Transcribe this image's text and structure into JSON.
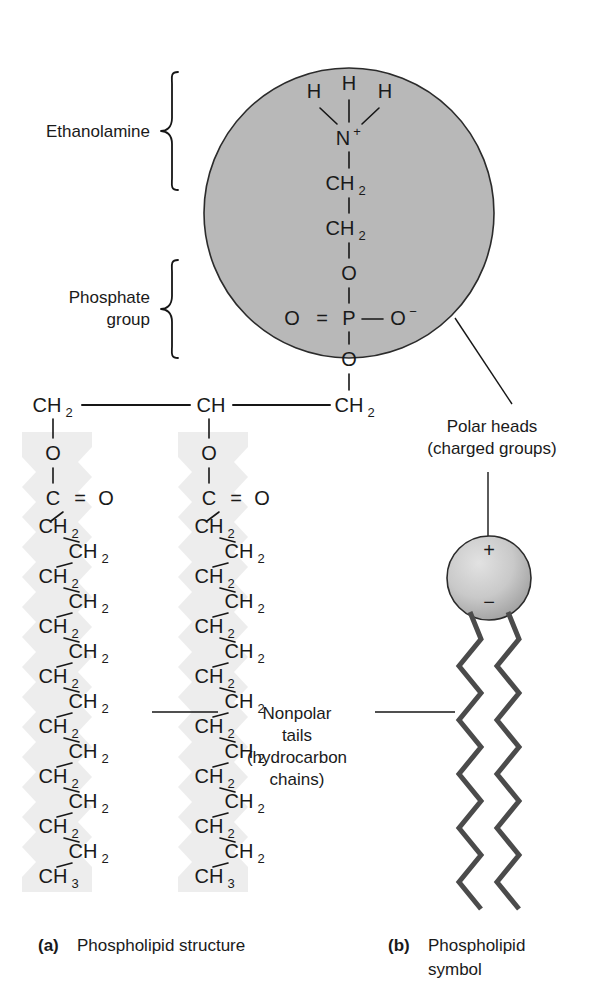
{
  "figure": {
    "background_color": "#ffffff",
    "ink_color": "#161616"
  },
  "colors": {
    "head_circle_fill": "#b8b8b8",
    "head_circle_stroke": "#2b2b2b",
    "tail_highlight": "#ececec",
    "tail_stroke": "#4b4b4b",
    "sphere_light": "#d8d8d8",
    "sphere_dark": "#9a9a9a",
    "text": "#1a1a1a"
  },
  "side_labels": {
    "ethanolamine": "Ethanolamine",
    "phosphate_line1": "Phosphate",
    "phosphate_line2": "group"
  },
  "callouts": {
    "polar_heads_line1": "Polar heads",
    "polar_heads_line2": "(charged groups)",
    "nonpolar_line1": "Nonpolar",
    "nonpolar_line2": "tails",
    "nonpolar_line3": "(hydrocarbon",
    "nonpolar_line4": "chains)"
  },
  "captions": {
    "a_marker": "(a)",
    "a_text": "Phospholipid  structure",
    "b_marker": "(b)",
    "b_text_line1": "Phospholipid",
    "b_text_line2": "symbol"
  },
  "head_group": {
    "hydrogens": [
      "H",
      "H",
      "H"
    ],
    "nitrogen": "N",
    "nitrogen_charge": "+",
    "chain": [
      "CH",
      "CH",
      "O"
    ],
    "chain_subscripts": [
      "2",
      "2",
      ""
    ],
    "phosphorus": "P",
    "phosphate_double_bond_oxygen": "O",
    "phosphate_anion_oxygen": "O",
    "phosphate_anion_charge": "−",
    "phosphate_ester_oxygen": "O",
    "double_bond_symbol": "="
  },
  "glycerol": {
    "left": "CH",
    "left_sub": "2",
    "middle": "CH",
    "middle_sub": "",
    "right": "CH",
    "right_sub": "2"
  },
  "ester": {
    "oxygen": "O",
    "carbonyl_carbon": "C",
    "carbonyl_oxygen": "O",
    "double_bond_symbol": "="
  },
  "chains": {
    "units_label": "CH",
    "units_sub": "2",
    "terminal_label": "CH",
    "terminal_sub": "3",
    "ch2_count_per_chain": 14,
    "chain_count": 2
  },
  "symbol": {
    "head_plus": "+",
    "head_minus": "−",
    "tail_count": 2
  }
}
